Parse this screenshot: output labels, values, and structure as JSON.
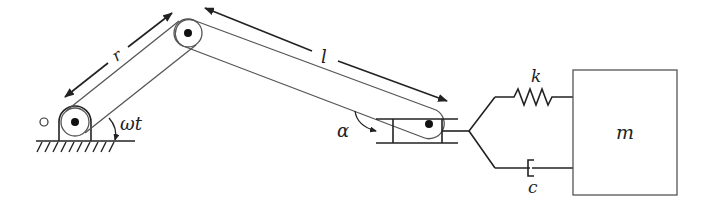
{
  "diagram": {
    "labels": {
      "crank_length": "r",
      "rod_length": "l",
      "crank_angle": "ωt",
      "rod_angle": "α",
      "spring": "k",
      "damper": "c",
      "mass": "m"
    },
    "components": [
      {
        "id": "ground-pivot",
        "type": "fixed support"
      },
      {
        "id": "crank",
        "type": "link",
        "label": "r"
      },
      {
        "id": "connecting-rod",
        "type": "link",
        "label": "l"
      },
      {
        "id": "slider",
        "type": "slider block"
      },
      {
        "id": "spring",
        "type": "spring",
        "label": "k"
      },
      {
        "id": "damper",
        "type": "dashpot",
        "label": "c"
      },
      {
        "id": "mass",
        "type": "block",
        "label": "m"
      }
    ],
    "colors": {
      "line": "#555555",
      "ink": "#222222",
      "background": "#ffffff"
    }
  }
}
